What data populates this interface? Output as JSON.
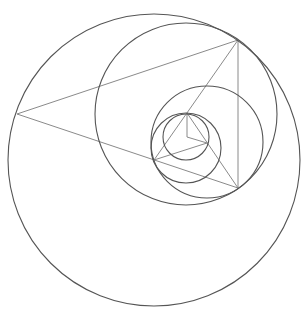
{
  "diagram": {
    "title": "",
    "colors": {
      "background": "#ffffff",
      "circle_stroke": "#555555",
      "line_stroke": "#8a8a8a"
    },
    "circles": [
      {
        "id": "outer",
        "cx": 154,
        "cy": 160,
        "r": 146
      },
      {
        "id": "second",
        "cx": 186,
        "cy": 114,
        "r": 91
      },
      {
        "id": "third",
        "cx": 207,
        "cy": 142,
        "r": 56
      },
      {
        "id": "fourth",
        "cx": 186,
        "cy": 148,
        "r": 35
      },
      {
        "id": "innermost",
        "cx": 186,
        "cy": 137,
        "r": 23
      }
    ],
    "lines": [
      {
        "id": "t1-top",
        "x1": 17,
        "y1": 114,
        "x2": 238,
        "y2": 40
      },
      {
        "id": "t1-bottom",
        "x1": 17,
        "y1": 114,
        "x2": 238,
        "y2": 188
      },
      {
        "id": "t1-right",
        "x1": 238,
        "y1": 40,
        "x2": 238,
        "y2": 188
      },
      {
        "id": "t2-left",
        "x1": 238,
        "y1": 40,
        "x2": 154,
        "y2": 160
      },
      {
        "id": "t2-right",
        "x1": 187,
        "y1": 113,
        "x2": 238,
        "y2": 188
      },
      {
        "id": "t3-base",
        "x1": 154,
        "y1": 160,
        "x2": 207,
        "y2": 143
      },
      {
        "id": "t4-vertical",
        "x1": 187,
        "y1": 113,
        "x2": 187,
        "y2": 137
      },
      {
        "id": "t4-base",
        "x1": 187,
        "y1": 137,
        "x2": 207,
        "y2": 143
      }
    ]
  }
}
